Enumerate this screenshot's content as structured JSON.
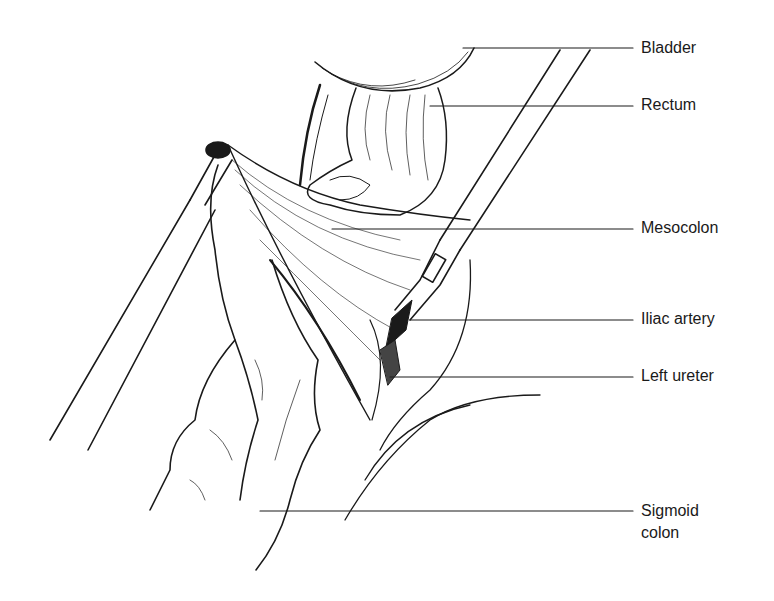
{
  "figure": {
    "type": "surgical anatomical line illustration",
    "labels": [
      {
        "id": "bladder",
        "text": "Bladder",
        "x": 641,
        "y": 38,
        "line_y": 48,
        "line_from": 463
      },
      {
        "id": "rectum",
        "text": "Rectum",
        "x": 641,
        "y": 95,
        "line_y": 106,
        "line_from": 430
      },
      {
        "id": "mesocolon",
        "text": "Mesocolon",
        "x": 641,
        "y": 218,
        "line_y": 229,
        "line_from": 332
      },
      {
        "id": "iliac-artery",
        "text": "Iliac artery",
        "x": 641,
        "y": 309,
        "line_y": 320,
        "line_from": 410
      },
      {
        "id": "left-ureter",
        "text": "Left ureter",
        "x": 641,
        "y": 366,
        "line_y": 377,
        "line_from": 390
      },
      {
        "id": "sigmoid-colon",
        "text": "Sigmoid colon",
        "line1": "Sigmoid",
        "line2": "colon",
        "x": 641,
        "y": 496,
        "line_y": 511,
        "line_from": 260
      }
    ]
  },
  "colors": {
    "ink": "#1a1a1a",
    "background": "#ffffff"
  }
}
